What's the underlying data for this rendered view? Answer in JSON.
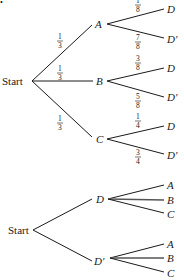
{
  "diagram_type": "probability-tree",
  "marker": "•",
  "tree1": {
    "root": "Start",
    "first_level": [
      {
        "node": "A",
        "prob": {
          "num": "1",
          "den": "3"
        },
        "children": [
          {
            "node": "D",
            "prob": {
              "num": "1",
              "den": "8"
            }
          },
          {
            "node": "D′",
            "prob": {
              "num": "7",
              "den": "8"
            }
          }
        ]
      },
      {
        "node": "B",
        "prob": {
          "num": "1",
          "den": "3"
        },
        "children": [
          {
            "node": "D",
            "prob": {
              "num": "3",
              "den": "8"
            }
          },
          {
            "node": "D′",
            "prob": {
              "num": "5",
              "den": "8"
            }
          }
        ]
      },
      {
        "node": "C",
        "prob": {
          "num": "1",
          "den": "3"
        },
        "children": [
          {
            "node": "D",
            "prob": {
              "num": "1",
              "den": "4"
            }
          },
          {
            "node": "D′",
            "prob": {
              "num": "3",
              "den": "4"
            }
          }
        ]
      }
    ]
  },
  "tree2": {
    "root": "Start",
    "first_level": [
      {
        "node": "D",
        "children": [
          {
            "node": "A"
          },
          {
            "node": "B"
          },
          {
            "node": "C"
          }
        ]
      },
      {
        "node": "D′",
        "children": [
          {
            "node": "A"
          },
          {
            "node": "B"
          },
          {
            "node": "C"
          }
        ]
      }
    ]
  }
}
